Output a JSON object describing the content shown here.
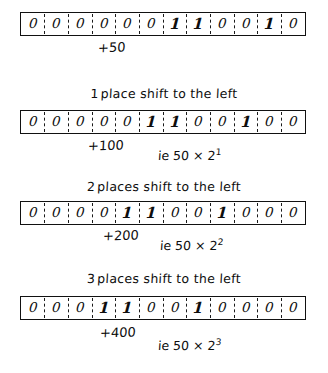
{
  "figure": {
    "register_bit_count": 12,
    "ink_color": "#111111",
    "paper_color": "#ffffff"
  },
  "blocks": [
    {
      "heading": "",
      "heading_lead": "",
      "bits": [
        "0",
        "0",
        "0",
        "0",
        "0",
        "0",
        "1",
        "1",
        "0",
        "0",
        "1",
        "0"
      ],
      "decimal_label": "+50",
      "note_prefix": "",
      "note_base": "",
      "note_exponent": ""
    },
    {
      "heading": "place shift to the left",
      "heading_lead": "1",
      "bits": [
        "0",
        "0",
        "0",
        "0",
        "0",
        "1",
        "1",
        "0",
        "0",
        "1",
        "0",
        "0"
      ],
      "decimal_label": "+100",
      "note_prefix": "ie 50 × 2",
      "note_base": "ie 50 × 2",
      "note_exponent": "1"
    },
    {
      "heading": "places shift to the left",
      "heading_lead": "2",
      "bits": [
        "0",
        "0",
        "0",
        "0",
        "1",
        "1",
        "0",
        "0",
        "1",
        "0",
        "0",
        "0"
      ],
      "decimal_label": "+200",
      "note_prefix": "ie 50 × 2",
      "note_base": "ie 50 × 2",
      "note_exponent": "2"
    },
    {
      "heading": "places shift to the left",
      "heading_lead": "3",
      "bits": [
        "0",
        "0",
        "0",
        "1",
        "1",
        "0",
        "0",
        "1",
        "0",
        "0",
        "0",
        "0"
      ],
      "decimal_label": "+400",
      "note_prefix": "ie 50 × 2",
      "note_base": "ie 50 × 2",
      "note_exponent": "3"
    }
  ]
}
